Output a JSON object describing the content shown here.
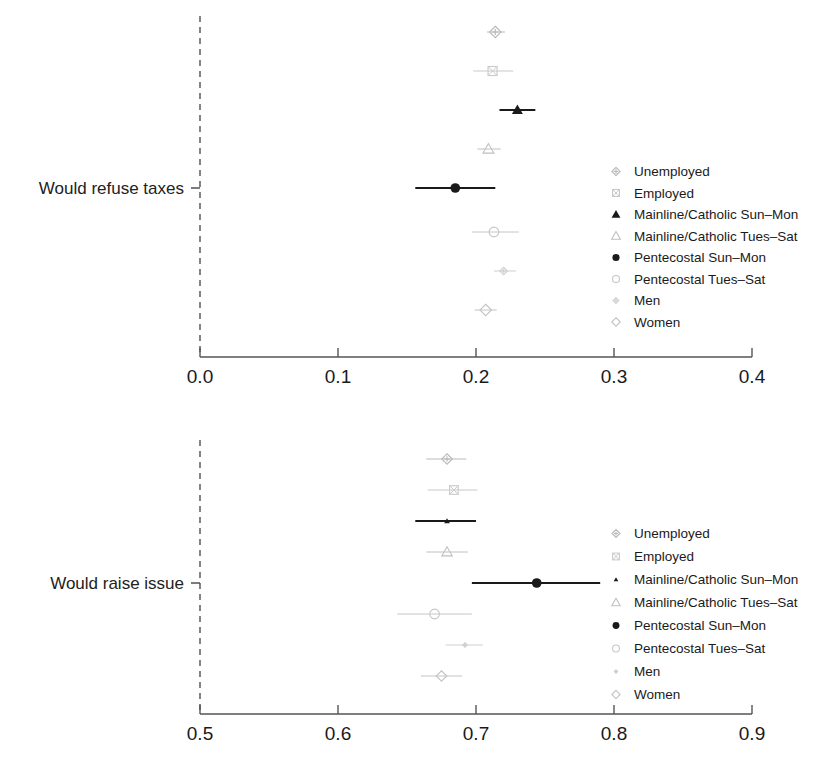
{
  "figure": {
    "background": "#ffffff",
    "width": 836,
    "height": 764
  },
  "legend_labels": [
    "Unemployed",
    "Employed",
    "Mainline/Catholic Sun–Mon",
    "Mainline/Catholic Tues–Sat",
    "Pentecostal Sun–Mon",
    "Pentecostal Tues–Sat",
    "Men",
    "Women"
  ],
  "marker_styles": [
    {
      "shape": "diamond-plus",
      "fill": "none",
      "color": "#b9b9b9"
    },
    {
      "shape": "square-x",
      "fill": "none",
      "color": "#c9c9c9"
    },
    {
      "shape": "triangle",
      "fill": "solid",
      "color": "#1a1a1a"
    },
    {
      "shape": "triangle",
      "fill": "none",
      "color": "#c0c0c0"
    },
    {
      "shape": "circle",
      "fill": "solid",
      "color": "#1a1a1a"
    },
    {
      "shape": "circle",
      "fill": "none",
      "color": "#c6c6c6"
    },
    {
      "shape": "diamond-plus",
      "fill": "none",
      "color": "#cfcfcf"
    },
    {
      "shape": "diamond",
      "fill": "none",
      "color": "#c4c4c4"
    }
  ],
  "panels": [
    {
      "id": "taxes",
      "row_label": "Would refuse taxes",
      "axis": {
        "min": 0.0,
        "max": 0.4,
        "ticks": [
          "0.0",
          "0.1",
          "0.2",
          "0.3",
          "0.4"
        ],
        "tick_values": [
          0.0,
          0.1,
          0.2,
          0.3,
          0.4
        ],
        "reference_line": 0.0
      },
      "legend_position": "right-middle",
      "estimates": [
        {
          "label": "Unemployed",
          "value": 0.214,
          "low": 0.208,
          "high": 0.221
        },
        {
          "label": "Employed",
          "value": 0.212,
          "low": 0.198,
          "high": 0.227
        },
        {
          "label": "Mainline/Catholic Sun–Mon",
          "value": 0.23,
          "low": 0.217,
          "high": 0.243
        },
        {
          "label": "Mainline/Catholic Tues–Sat",
          "value": 0.209,
          "low": 0.201,
          "high": 0.218
        },
        {
          "label": "Pentecostal Sun–Mon",
          "value": 0.185,
          "low": 0.156,
          "high": 0.214
        },
        {
          "label": "Pentecostal Tues–Sat",
          "value": 0.213,
          "low": 0.197,
          "high": 0.231
        },
        {
          "label": "Men",
          "value": 0.22,
          "low": 0.213,
          "high": 0.229
        },
        {
          "label": "Women",
          "value": 0.207,
          "low": 0.199,
          "high": 0.215
        }
      ]
    },
    {
      "id": "issue",
      "row_label": "Would raise issue",
      "axis": {
        "min": 0.5,
        "max": 0.9,
        "ticks": [
          "0.5",
          "0.6",
          "0.7",
          "0.8",
          "0.9"
        ],
        "tick_values": [
          0.5,
          0.6,
          0.7,
          0.8,
          0.9
        ],
        "reference_line": 0.5
      },
      "legend_position": "right-middle",
      "estimates": [
        {
          "label": "Unemployed",
          "value": 0.679,
          "low": 0.664,
          "high": 0.693
        },
        {
          "label": "Employed",
          "value": 0.684,
          "low": 0.665,
          "high": 0.701
        },
        {
          "label": "Mainline/Catholic Sun–Mon",
          "value": 0.679,
          "low": 0.656,
          "high": 0.7
        },
        {
          "label": "Mainline/Catholic Tues–Sat",
          "value": 0.679,
          "low": 0.664,
          "high": 0.694
        },
        {
          "label": "Pentecostal Sun–Mon",
          "value": 0.744,
          "low": 0.697,
          "high": 0.79
        },
        {
          "label": "Pentecostal Tues–Sat",
          "value": 0.67,
          "low": 0.643,
          "high": 0.697
        },
        {
          "label": "Men",
          "value": 0.692,
          "low": 0.678,
          "high": 0.705
        },
        {
          "label": "Women",
          "value": 0.675,
          "low": 0.66,
          "high": 0.69
        }
      ]
    }
  ],
  "chart_data": {
    "type": "scatter",
    "subtype": "forest-plot",
    "title": "",
    "xlabel": "",
    "ylabel": "",
    "grid": false,
    "legend_position": "right",
    "panels": [
      {
        "name": "Would refuse taxes",
        "xlim": [
          0.0,
          0.4
        ],
        "xticks": [
          0.0,
          0.1,
          0.2,
          0.3,
          0.4
        ],
        "xticklabels": [
          "0.0",
          "0.1",
          "0.2",
          "0.3",
          "0.4"
        ],
        "reference_line": 0.0,
        "categories": [
          "Unemployed",
          "Employed",
          "Mainline/Catholic Sun–Mon",
          "Mainline/Catholic Tues–Sat",
          "Pentecostal Sun–Mon",
          "Pentecostal Tues–Sat",
          "Men",
          "Women"
        ],
        "values": [
          0.214,
          0.212,
          0.23,
          0.209,
          0.185,
          0.213,
          0.22,
          0.207
        ],
        "ci_low": [
          0.208,
          0.198,
          0.217,
          0.201,
          0.156,
          0.197,
          0.213,
          0.199
        ],
        "ci_high": [
          0.221,
          0.227,
          0.243,
          0.218,
          0.214,
          0.231,
          0.229,
          0.215
        ]
      },
      {
        "name": "Would raise issue",
        "xlim": [
          0.5,
          0.9
        ],
        "xticks": [
          0.5,
          0.6,
          0.7,
          0.8,
          0.9
        ],
        "xticklabels": [
          "0.5",
          "0.6",
          "0.7",
          "0.8",
          "0.9"
        ],
        "reference_line": 0.5,
        "categories": [
          "Unemployed",
          "Employed",
          "Mainline/Catholic Sun–Mon",
          "Mainline/Catholic Tues–Sat",
          "Pentecostal Sun–Mon",
          "Pentecostal Tues–Sat",
          "Men",
          "Women"
        ],
        "values": [
          0.679,
          0.684,
          0.679,
          0.679,
          0.744,
          0.67,
          0.692,
          0.675
        ],
        "ci_low": [
          0.664,
          0.665,
          0.656,
          0.664,
          0.697,
          0.643,
          0.678,
          0.66
        ],
        "ci_high": [
          0.693,
          0.701,
          0.7,
          0.694,
          0.79,
          0.697,
          0.705,
          0.69
        ]
      }
    ]
  }
}
